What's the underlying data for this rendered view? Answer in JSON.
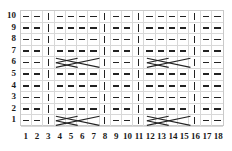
{
  "chart_data": {
    "type": "table",
    "columns": 18,
    "rows": 10,
    "row_labels": [
      "10",
      "9",
      "8",
      "7",
      "6",
      "5",
      "4",
      "3",
      "2",
      "1"
    ],
    "column_labels": [
      "1",
      "2",
      "3",
      "4",
      "5",
      "6",
      "7",
      "8",
      "9",
      "10",
      "11",
      "12",
      "13",
      "14",
      "15",
      "16",
      "17",
      "18"
    ],
    "symbols": {
      "dash": "purl-stitch",
      "bar": "knit-stitch",
      "cable": "cable-cross-4"
    },
    "colors": {
      "symbol": "#222222",
      "gridline": "#d8d8d8",
      "border": "#c9c9c9",
      "background": "#ffffff",
      "label": "#1a1a1a"
    },
    "knit_columns": [
      3,
      8,
      11,
      16
    ],
    "cable_rows": [
      1,
      6
    ],
    "cable_spans": [
      [
        4,
        7
      ],
      [
        12,
        15
      ]
    ],
    "cells": [
      [
        "dash",
        "dash",
        "bar",
        "dash",
        "dash",
        "dash",
        "dash",
        "bar",
        "dash",
        "dash",
        "bar",
        "dash",
        "dash",
        "dash",
        "dash",
        "bar",
        "dash",
        "dash"
      ],
      [
        "dash",
        "dash",
        "bar",
        "dash",
        "dash",
        "dash",
        "dash",
        "bar",
        "dash",
        "dash",
        "bar",
        "dash",
        "dash",
        "dash",
        "dash",
        "bar",
        "dash",
        "dash"
      ],
      [
        "dash",
        "dash",
        "bar",
        "dash",
        "dash",
        "dash",
        "dash",
        "bar",
        "dash",
        "dash",
        "bar",
        "dash",
        "dash",
        "dash",
        "dash",
        "bar",
        "dash",
        "dash"
      ],
      [
        "dash",
        "dash",
        "bar",
        "dash",
        "dash",
        "dash",
        "dash",
        "bar",
        "dash",
        "dash",
        "bar",
        "dash",
        "dash",
        "dash",
        "dash",
        "bar",
        "dash",
        "dash"
      ],
      [
        "dash",
        "dash",
        "bar",
        "cable",
        "cable",
        "cable",
        "cable",
        "bar",
        "dash",
        "dash",
        "bar",
        "cable",
        "cable",
        "cable",
        "cable",
        "bar",
        "dash",
        "dash"
      ],
      [
        "dash",
        "dash",
        "bar",
        "dash",
        "dash",
        "dash",
        "dash",
        "bar",
        "dash",
        "dash",
        "bar",
        "dash",
        "dash",
        "dash",
        "dash",
        "bar",
        "dash",
        "dash"
      ],
      [
        "dash",
        "dash",
        "bar",
        "dash",
        "dash",
        "dash",
        "dash",
        "bar",
        "dash",
        "dash",
        "bar",
        "dash",
        "dash",
        "dash",
        "dash",
        "bar",
        "dash",
        "dash"
      ],
      [
        "dash",
        "dash",
        "bar",
        "dash",
        "dash",
        "dash",
        "dash",
        "bar",
        "dash",
        "dash",
        "bar",
        "dash",
        "dash",
        "dash",
        "dash",
        "bar",
        "dash",
        "dash"
      ],
      [
        "dash",
        "dash",
        "bar",
        "dash",
        "dash",
        "dash",
        "dash",
        "bar",
        "dash",
        "dash",
        "bar",
        "dash",
        "dash",
        "dash",
        "dash",
        "bar",
        "dash",
        "dash"
      ],
      [
        "dash",
        "dash",
        "bar",
        "cable",
        "cable",
        "cable",
        "cable",
        "bar",
        "dash",
        "dash",
        "bar",
        "cable",
        "cable",
        "cable",
        "cable",
        "bar",
        "dash",
        "dash"
      ]
    ]
  }
}
